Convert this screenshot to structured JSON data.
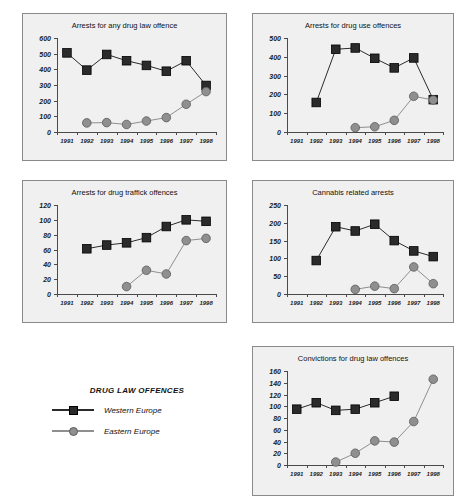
{
  "figure": {
    "background": "#ffffff",
    "panel_background": "#f0f0f0",
    "panel_border": "#8a8a8a"
  },
  "legend": {
    "title": "DRUG LAW OFFENCES",
    "entries": [
      {
        "label": "Western Europe",
        "marker": "square",
        "color": "#2b2b2b",
        "line_color": "#2b2b2b"
      },
      {
        "label": "Eastern Europe",
        "marker": "circle",
        "color": "#8f8f8f",
        "line_color": "#8f8f8f"
      }
    ]
  },
  "chart_data": [
    {
      "id": "chart-any-drug-law-offence",
      "type": "line",
      "title": "Arrests for any drug law offence",
      "xlabel": "",
      "ylabel": "",
      "categories": [
        "1991",
        "1992",
        "1993",
        "1994",
        "1995",
        "1996",
        "1997",
        "1998"
      ],
      "ylim": [
        0,
        600
      ],
      "yticks": [
        0,
        100,
        200,
        300,
        400,
        500,
        600
      ],
      "grid": false,
      "legend_position": "external",
      "series": [
        {
          "name": "Western Europe",
          "marker": "square",
          "color": "#2b2b2b",
          "values": [
            505,
            395,
            495,
            455,
            425,
            388,
            455,
            297
          ]
        },
        {
          "name": "Eastern Europe",
          "marker": "circle",
          "color": "#8f8f8f",
          "values": [
            null,
            58,
            60,
            48,
            70,
            92,
            177,
            258
          ]
        }
      ]
    },
    {
      "id": "chart-drug-use-offences",
      "type": "line",
      "title": "Arrests for drug use offences",
      "xlabel": "",
      "ylabel": "",
      "categories": [
        "1991",
        "1992",
        "1993",
        "1994",
        "1995",
        "1996",
        "1997",
        "1998"
      ],
      "ylim": [
        0,
        500
      ],
      "yticks": [
        0,
        100,
        200,
        300,
        400,
        500
      ],
      "grid": false,
      "legend_position": "external",
      "series": [
        {
          "name": "Western Europe",
          "marker": "square",
          "color": "#2b2b2b",
          "values": [
            null,
            157,
            440,
            447,
            392,
            341,
            394,
            172
          ]
        },
        {
          "name": "Eastern Europe",
          "marker": "circle",
          "color": "#8f8f8f",
          "values": [
            null,
            null,
            null,
            23,
            28,
            62,
            190,
            170
          ]
        }
      ]
    },
    {
      "id": "chart-drug-traffick-offences",
      "type": "line",
      "title": "Arrests for drug traffick offences",
      "xlabel": "",
      "ylabel": "",
      "categories": [
        "1991",
        "1992",
        "1993",
        "1994",
        "1995",
        "1996",
        "1997",
        "1998"
      ],
      "ylim": [
        0,
        120
      ],
      "yticks": [
        0,
        20,
        40,
        60,
        80,
        100,
        120
      ],
      "grid": false,
      "legend_position": "external",
      "series": [
        {
          "name": "Western Europe",
          "marker": "square",
          "color": "#2b2b2b",
          "values": [
            null,
            61,
            66,
            69,
            76,
            91,
            100,
            98
          ]
        },
        {
          "name": "Eastern Europe",
          "marker": "circle",
          "color": "#8f8f8f",
          "values": [
            null,
            null,
            null,
            10,
            32,
            27,
            72,
            75
          ]
        }
      ]
    },
    {
      "id": "chart-cannabis-related-arrests",
      "type": "line",
      "title": "Cannabis related arrests",
      "xlabel": "",
      "ylabel": "",
      "categories": [
        "1991",
        "1992",
        "1993",
        "1994",
        "1995",
        "1996",
        "1997",
        "1998"
      ],
      "ylim": [
        0,
        250
      ],
      "yticks": [
        0,
        50,
        100,
        150,
        200,
        250
      ],
      "grid": false,
      "legend_position": "external",
      "series": [
        {
          "name": "Western Europe",
          "marker": "square",
          "color": "#2b2b2b",
          "values": [
            null,
            94,
            189,
            177,
            196,
            150,
            121,
            105
          ]
        },
        {
          "name": "Eastern Europe",
          "marker": "circle",
          "color": "#8f8f8f",
          "values": [
            null,
            null,
            null,
            13,
            22,
            15,
            76,
            29
          ]
        }
      ]
    },
    {
      "id": "chart-convictions-drug-law-offences",
      "type": "line",
      "title": "Convictions for drug law offences",
      "xlabel": "",
      "ylabel": "",
      "categories": [
        "1991",
        "1992",
        "1993",
        "1994",
        "1995",
        "1996",
        "1997",
        "1998"
      ],
      "ylim": [
        0,
        160
      ],
      "yticks": [
        0,
        20,
        40,
        60,
        80,
        100,
        120,
        140,
        160
      ],
      "grid": false,
      "legend_position": "external",
      "series": [
        {
          "name": "Western Europe",
          "marker": "square",
          "color": "#2b2b2b",
          "values": [
            95,
            106,
            93,
            95,
            106,
            117,
            null,
            null
          ]
        },
        {
          "name": "Eastern Europe",
          "marker": "circle",
          "color": "#8f8f8f",
          "values": [
            null,
            null,
            5,
            20,
            41,
            39,
            74,
            146
          ]
        }
      ]
    }
  ]
}
